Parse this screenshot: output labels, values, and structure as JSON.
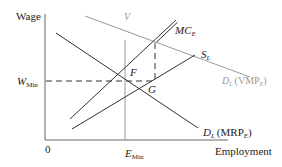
{
  "diagram": {
    "y_axis_label": "Wage",
    "x_axis_label": "Employment",
    "origin_label": "0",
    "w_min_label": {
      "main": "W",
      "sub": "Min"
    },
    "e_min_label": {
      "main": "E",
      "sub": "Min"
    },
    "v_label": "V",
    "point_f": "F",
    "point_g": "G",
    "curves": {
      "mc": {
        "main": "MC",
        "sub": "E"
      },
      "supply": {
        "main": "S",
        "sub": "L"
      },
      "vmp": {
        "main": "D",
        "sub": "L",
        "paren": "(VMP",
        "paren_sub": "E",
        "close": ")"
      },
      "mrp": {
        "main": "D",
        "sub": "L",
        "paren": "(MRP",
        "paren_sub": "E",
        "close": ")"
      }
    },
    "colors": {
      "axis": "#666666",
      "dark_line": "#333333",
      "light_line": "#999999",
      "text": "#222222",
      "light_text": "#999999"
    }
  }
}
